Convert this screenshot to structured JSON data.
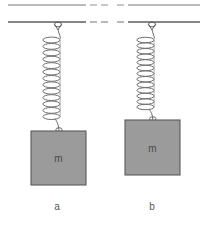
{
  "figure": {
    "width": 206,
    "height": 225,
    "background": "#ffffff"
  },
  "ceiling": {
    "line_color": "#6e6e6e",
    "upper_line_y": 5,
    "lower_line_y": 22,
    "break_gap_start_x": 88,
    "break_gap_end_x": 120,
    "break_style": "dashed"
  },
  "systems": [
    {
      "id": "a",
      "caption": "a",
      "anchor_x": 58,
      "anchor_y": 22,
      "spring": {
        "top_y": 30,
        "bottom_y": 123,
        "coils": 13,
        "width": 18,
        "color": "#6e6e6e",
        "state": "stretched"
      },
      "block": {
        "label": "m",
        "x": 31,
        "y": 131,
        "width": 55,
        "height": 54,
        "fill": "#9b9b9b",
        "stroke": "#5a5a5a"
      }
    },
    {
      "id": "b",
      "caption": "b",
      "anchor_x": 152,
      "anchor_y": 22,
      "spring": {
        "top_y": 30,
        "bottom_y": 112,
        "coils": 13,
        "width": 18,
        "color": "#6e6e6e",
        "state": "less-stretched"
      },
      "block": {
        "label": "m",
        "x": 125,
        "y": 120,
        "width": 55,
        "height": 55,
        "fill": "#9b9b9b",
        "stroke": "#5a5a5a"
      }
    }
  ],
  "labels": {
    "mass_symbol": "m",
    "caption_a": "a",
    "caption_b": "b"
  },
  "colors": {
    "line": "#6e6e6e",
    "block_fill": "#9b9b9b",
    "block_stroke": "#5a5a5a",
    "text": "#555555",
    "background": "#ffffff"
  }
}
